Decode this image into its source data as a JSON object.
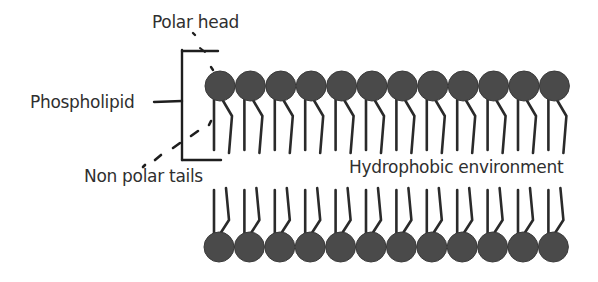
{
  "labels": {
    "polar_head": "Polar head",
    "phospholipid": "Phospholipid",
    "non_polar_tails": "Non polar tails",
    "hydrophobic_environment": "Hydrophobic environment"
  },
  "bilayer": {
    "top_layer_count": 12,
    "bottom_layer_count": 12,
    "head_color": "#4a4a4a",
    "tail_color": "#2a2a2a",
    "top_layer": {
      "first_head_x": 220,
      "spacing": 30.4,
      "head_y": 86,
      "head_r": 15
    },
    "bottom_layer": {
      "first_head_x": 219,
      "spacing": 30.4,
      "head_y": 247,
      "head_r": 15
    }
  },
  "colors": {
    "background": "#ffffff",
    "text": "#2f2f2f",
    "line": "#1e1e1e"
  }
}
